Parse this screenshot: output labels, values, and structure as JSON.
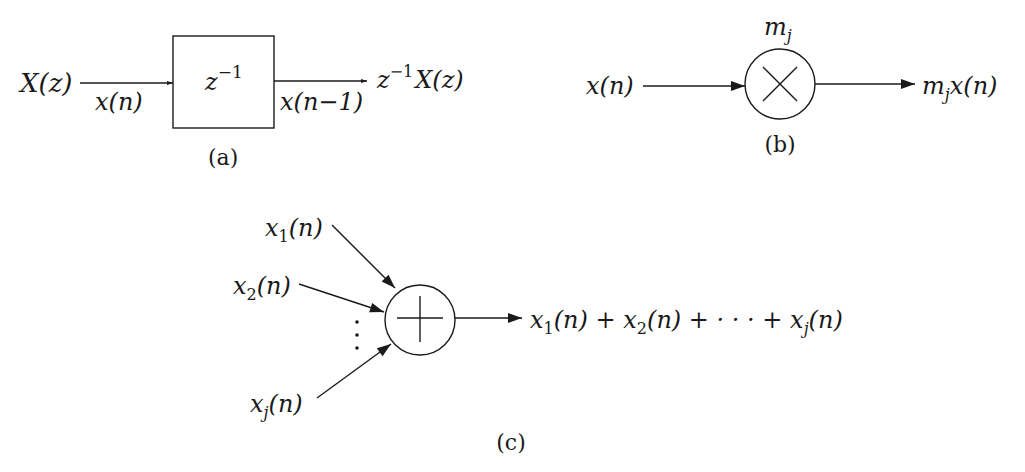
{
  "diagram": {
    "panel_a": {
      "caption": "(a)",
      "input_label": "X(z)",
      "input_signal": "x(n)",
      "block_label_base": "z",
      "block_label_exp": "−1",
      "output_signal": "x(n−1)",
      "output_label_base": "z",
      "output_label_exp": "−1",
      "output_label_rest": "X(z)"
    },
    "panel_b": {
      "caption": "(b)",
      "input_signal": "x(n)",
      "gain_base": "m",
      "gain_sub": "j",
      "operator": "multiply",
      "output_base": "m",
      "output_sub": "j",
      "output_rest": "x(n)"
    },
    "panel_c": {
      "caption": "(c)",
      "operator": "add",
      "inputs": [
        {
          "base": "x",
          "sub": "1",
          "rest": "(n)"
        },
        {
          "base": "x",
          "sub": "2",
          "rest": "(n)"
        },
        {
          "base": "x",
          "sub": "j",
          "rest": "(n)"
        }
      ],
      "ellipsis": "⋮",
      "output": {
        "t1_base": "x",
        "t1_sub": "1",
        "t1_rest": "(n) + ",
        "t2_base": "x",
        "t2_sub": "2",
        "t2_rest": "(n) + · · · + ",
        "t3_base": "x",
        "t3_sub": "j",
        "t3_rest": "(n)"
      }
    }
  }
}
